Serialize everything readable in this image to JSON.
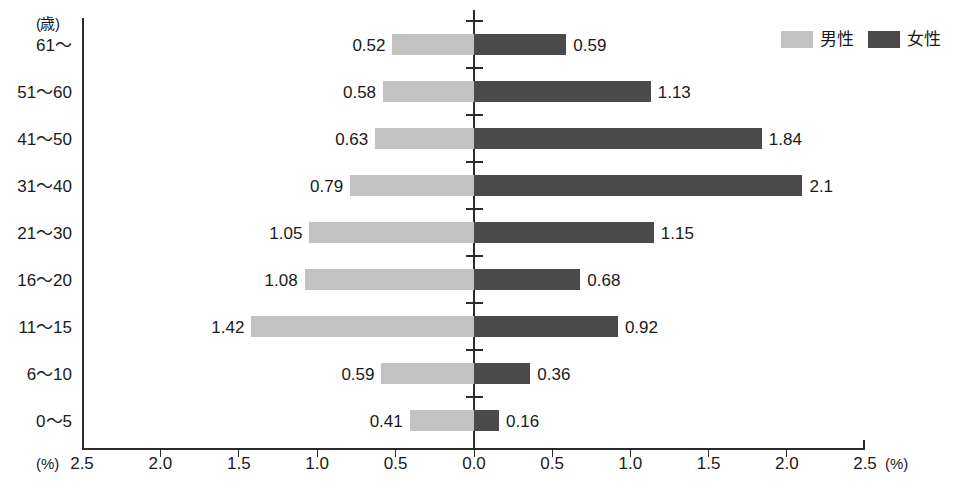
{
  "chart_data": {
    "type": "bar",
    "subtype": "diverging-horizontal-bar",
    "title": "",
    "xlabel": "(%)",
    "ylabel": "(歳)",
    "grid": false,
    "legend_position": "top-right",
    "categories": [
      "61～",
      "51～60",
      "41～50",
      "31～40",
      "21～30",
      "16～20",
      "11～15",
      "6～10",
      "0～5"
    ],
    "series": [
      {
        "name": "男性",
        "side": "left",
        "color": "#c2c2c2",
        "values": [
          0.52,
          0.58,
          0.63,
          0.79,
          1.05,
          1.08,
          1.42,
          0.59,
          0.41
        ],
        "labels": [
          "0.52",
          "0.58",
          "0.63",
          "0.79",
          "1.05",
          "1.08",
          "1.42",
          "0.59",
          "0.41"
        ]
      },
      {
        "name": "女性",
        "side": "right",
        "color": "#4a4a4a",
        "values": [
          0.59,
          1.13,
          1.84,
          2.1,
          1.15,
          0.68,
          0.92,
          0.36,
          0.16
        ],
        "labels": [
          "0.59",
          "1.13",
          "1.84",
          "2.1",
          "1.15",
          "0.68",
          "0.92",
          "0.36",
          "0.16"
        ]
      }
    ],
    "xlim": [
      2.5,
      2.5
    ],
    "xtick_values_left": [
      2.5,
      2.0,
      1.5,
      1.0,
      0.5
    ],
    "xtick_values_right": [
      0.0,
      0.5,
      1.0,
      1.5,
      2.0,
      2.5
    ],
    "xtick_labels": [
      "2.5",
      "2.0",
      "1.5",
      "1.0",
      "0.5",
      "0.0",
      "0.5",
      "1.0",
      "1.5",
      "2.0",
      "2.5"
    ],
    "xtick_step": 0.5
  },
  "axis": {
    "unit_y": "(歳)",
    "unit_x_left": "(%)",
    "unit_x_right": "(%)"
  },
  "legend": {
    "items": [
      {
        "label": "男性",
        "color": "#c2c2c2"
      },
      {
        "label": "女性",
        "color": "#4a4a4a"
      }
    ]
  },
  "colors": {
    "male": "#c2c2c2",
    "female": "#4a4a4a",
    "axis": "#2b2b2b",
    "text": "#1a1a1a",
    "background": "#ffffff"
  }
}
